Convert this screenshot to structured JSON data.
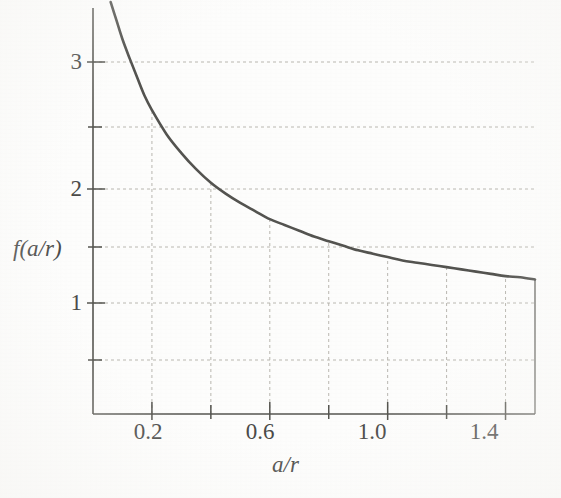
{
  "chart_data": {
    "type": "line",
    "title": "",
    "xlabel": "a/r",
    "ylabel": "f(a/r)",
    "xlim": [
      0.0,
      1.5
    ],
    "ylim": [
      0.0,
      3.6
    ],
    "grid": true,
    "legend": "none",
    "x_tick_labels": [
      "0.2",
      "0.6",
      "1.0",
      "1.4"
    ],
    "x_tick_values": [
      0.2,
      0.6,
      1.0,
      1.4
    ],
    "x_minor_tick_values": [
      0.4,
      0.8,
      1.2
    ],
    "y_tick_labels": [
      "1",
      "2",
      "3"
    ],
    "y_tick_values": [
      1,
      2,
      3
    ],
    "y_minor_tick_values": [
      0.5,
      1.5,
      2.5
    ],
    "series": [
      {
        "name": "f(a/r)",
        "color": "#53524f",
        "x": [
          0.06,
          0.08,
          0.1,
          0.125,
          0.15,
          0.175,
          0.2,
          0.25,
          0.3,
          0.35,
          0.4,
          0.45,
          0.5,
          0.55,
          0.6,
          0.65,
          0.7,
          0.75,
          0.8,
          0.85,
          0.9,
          0.95,
          1.0,
          1.05,
          1.1,
          1.15,
          1.2,
          1.25,
          1.3,
          1.35,
          1.4,
          1.45,
          1.5
        ],
        "y": [
          3.58,
          3.4,
          3.22,
          3.03,
          2.88,
          2.74,
          2.63,
          2.44,
          2.29,
          2.16,
          2.05,
          1.96,
          1.88,
          1.81,
          1.74,
          1.69,
          1.64,
          1.59,
          1.55,
          1.51,
          1.47,
          1.44,
          1.41,
          1.38,
          1.36,
          1.34,
          1.32,
          1.3,
          1.28,
          1.26,
          1.24,
          1.23,
          1.21
        ]
      }
    ]
  },
  "axes": {
    "y_axis_title": "f(a/r)",
    "x_axis_title": "a/r"
  },
  "ticks": {
    "x": [
      {
        "label": "0.2",
        "value": 0.2
      },
      {
        "label": "0.6",
        "value": 0.6
      },
      {
        "label": "1.0",
        "value": 1.0
      },
      {
        "label": "1.4",
        "value": 1.4
      }
    ],
    "y": [
      {
        "label": "3",
        "value": 3
      },
      {
        "label": "2",
        "value": 2
      },
      {
        "label": "1",
        "value": 1
      }
    ]
  },
  "style": {
    "curve_color": "#53524f",
    "axis_color": "#55544f",
    "grid_color": "#b9b7b0",
    "background": "#fdfdfc",
    "text_color": "#4a4a48"
  }
}
